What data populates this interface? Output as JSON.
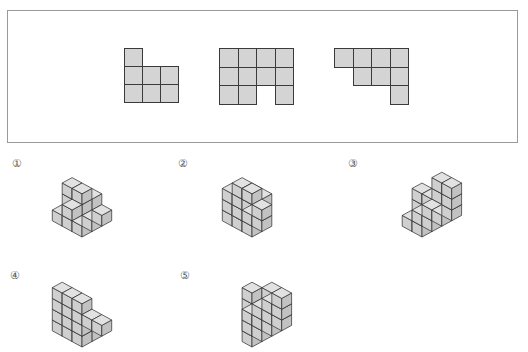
{
  "problem": {
    "frame_label": "top-views-frame",
    "views": [
      {
        "name": "view-1",
        "origin": [
          124,
          48
        ],
        "cell_size": 18,
        "cells": [
          [
            0,
            0
          ],
          [
            0,
            1
          ],
          [
            1,
            1
          ],
          [
            2,
            1
          ],
          [
            0,
            2
          ],
          [
            1,
            2
          ],
          [
            2,
            2
          ]
        ]
      },
      {
        "name": "view-2",
        "origin": [
          219,
          48
        ],
        "cell_size": 18.5,
        "cells": [
          [
            0,
            0
          ],
          [
            1,
            0
          ],
          [
            2,
            0
          ],
          [
            3,
            0
          ],
          [
            0,
            1
          ],
          [
            1,
            1
          ],
          [
            2,
            1
          ],
          [
            3,
            1
          ],
          [
            0,
            2
          ],
          [
            1,
            2
          ],
          [
            3,
            2
          ]
        ]
      },
      {
        "name": "view-3",
        "origin": [
          334,
          48
        ],
        "cell_size": 18.5,
        "cells": [
          [
            0,
            0
          ],
          [
            1,
            0
          ],
          [
            2,
            0
          ],
          [
            3,
            0
          ],
          [
            1,
            1
          ],
          [
            2,
            1
          ],
          [
            3,
            1
          ],
          [
            3,
            2
          ]
        ]
      }
    ]
  },
  "options": [
    {
      "number": "①",
      "label_pos": [
        12,
        158
      ],
      "fig_pos": [
        22,
        162
      ]
    },
    {
      "number": "②",
      "label_pos": [
        178,
        158
      ],
      "fig_pos": [
        192,
        162
      ]
    },
    {
      "number": "③",
      "label_pos": [
        348,
        158
      ],
      "fig_pos": [
        362,
        162
      ]
    },
    {
      "number": "④",
      "label_pos": [
        10,
        270
      ],
      "fig_pos": [
        22,
        272
      ]
    },
    {
      "number": "⑤",
      "label_pos": [
        180,
        270
      ],
      "fig_pos": [
        192,
        272
      ]
    }
  ],
  "colors": {
    "cube_top": "#e2e2e2",
    "cube_left": "#cfcfcf",
    "cube_right": "#c2c2c2",
    "grid_cell": "#d4d4d4",
    "line": "#2e2e2e",
    "frame_border": "#9a9a9a"
  }
}
